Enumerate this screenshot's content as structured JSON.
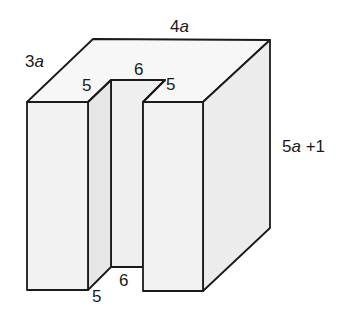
{
  "figure": {
    "type": "3d-solid-with-rectangular-slot",
    "colors": {
      "stroke": "#1a1a1a",
      "front_face": "#f2f2f2",
      "top_face": "#f7f7f7",
      "side_face": "#ececec",
      "slot_back": "#efefef",
      "slot_side": "#e6e6e6"
    },
    "labels": {
      "depth": "3a",
      "width": "4a",
      "height": "5a +1",
      "slot_top_left_depth": "5",
      "slot_top_width": "6",
      "slot_top_right_depth": "5",
      "slot_bottom_width": "6",
      "slot_bottom_depth": "5"
    }
  }
}
